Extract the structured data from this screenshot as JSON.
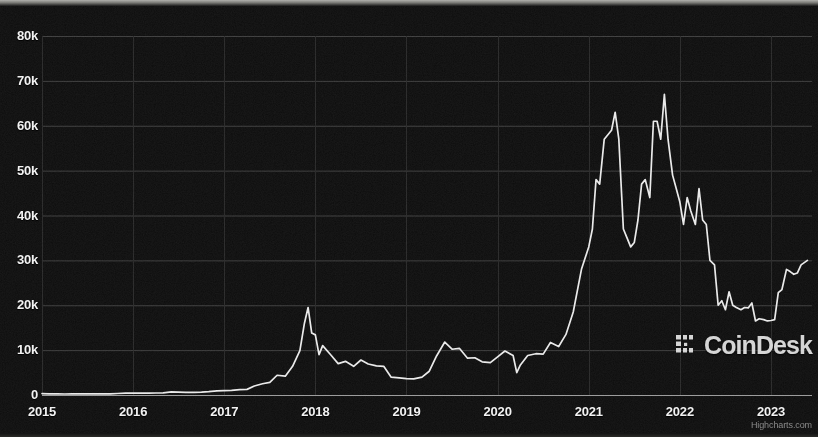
{
  "chart_data": {
    "type": "line",
    "title": "",
    "subtitle": "",
    "xlabel": "",
    "ylabel": "",
    "series_name": "Bitcoin Price (USD)",
    "grid": true,
    "legend_position": "none",
    "line_color": "#e9e9e9",
    "background_color": "#0c0c0c",
    "gridline_color": "#3c3c3c",
    "axis_label_color": "#f2f2f2",
    "xlim": [
      2015.0,
      2023.45
    ],
    "ylim": [
      0,
      80000
    ],
    "y_ticks": [
      0,
      10000,
      20000,
      30000,
      40000,
      50000,
      60000,
      70000,
      80000
    ],
    "y_tick_labels": [
      "0",
      "10k",
      "20k",
      "30k",
      "40k",
      "50k",
      "60k",
      "70k",
      "80k"
    ],
    "x_ticks": [
      2015,
      2016,
      2017,
      2018,
      2019,
      2020,
      2021,
      2022,
      2023
    ],
    "x_tick_labels": [
      "2015",
      "2016",
      "2017",
      "2018",
      "2019",
      "2020",
      "2021",
      "2022",
      "2023"
    ],
    "x": [
      2015.0,
      2015.08,
      2015.17,
      2015.25,
      2015.33,
      2015.42,
      2015.5,
      2015.58,
      2015.67,
      2015.75,
      2015.83,
      2015.92,
      2016.0,
      2016.08,
      2016.17,
      2016.25,
      2016.33,
      2016.42,
      2016.5,
      2016.58,
      2016.67,
      2016.75,
      2016.83,
      2016.92,
      2017.0,
      2017.08,
      2017.17,
      2017.25,
      2017.33,
      2017.42,
      2017.5,
      2017.58,
      2017.67,
      2017.75,
      2017.83,
      2017.88,
      2017.92,
      2017.96,
      2018.0,
      2018.04,
      2018.08,
      2018.17,
      2018.25,
      2018.33,
      2018.42,
      2018.5,
      2018.58,
      2018.67,
      2018.75,
      2018.83,
      2018.92,
      2019.0,
      2019.08,
      2019.17,
      2019.25,
      2019.33,
      2019.42,
      2019.5,
      2019.58,
      2019.67,
      2019.75,
      2019.83,
      2019.92,
      2020.0,
      2020.08,
      2020.17,
      2020.21,
      2020.25,
      2020.33,
      2020.42,
      2020.5,
      2020.58,
      2020.67,
      2020.75,
      2020.83,
      2020.92,
      2021.0,
      2021.04,
      2021.08,
      2021.12,
      2021.17,
      2021.21,
      2021.25,
      2021.29,
      2021.33,
      2021.38,
      2021.42,
      2021.46,
      2021.5,
      2021.54,
      2021.58,
      2021.62,
      2021.67,
      2021.71,
      2021.75,
      2021.79,
      2021.83,
      2021.87,
      2021.92,
      2021.96,
      2022.0,
      2022.04,
      2022.08,
      2022.12,
      2022.17,
      2022.21,
      2022.25,
      2022.29,
      2022.33,
      2022.38,
      2022.42,
      2022.46,
      2022.5,
      2022.54,
      2022.58,
      2022.62,
      2022.67,
      2022.71,
      2022.75,
      2022.79,
      2022.83,
      2022.87,
      2022.92,
      2022.96,
      2023.0,
      2023.04,
      2023.08,
      2023.12,
      2023.17,
      2023.21,
      2023.25,
      2023.29,
      2023.33,
      2023.4
    ],
    "values": [
      315,
      250,
      245,
      225,
      235,
      240,
      275,
      230,
      240,
      250,
      330,
      420,
      435,
      400,
      415,
      450,
      460,
      680,
      655,
      575,
      605,
      640,
      735,
      920,
      975,
      1010,
      1190,
      1250,
      2000,
      2500,
      2800,
      4400,
      4200,
      6400,
      9900,
      16000,
      19500,
      13800,
      13400,
      9000,
      11000,
      8900,
      7000,
      7500,
      6400,
      7800,
      6900,
      6500,
      6400,
      4000,
      3800,
      3650,
      3600,
      4000,
      5300,
      8700,
      11800,
      10200,
      10400,
      8200,
      8300,
      7400,
      7200,
      8500,
      9800,
      8800,
      5000,
      6700,
      8800,
      9200,
      9100,
      11700,
      10800,
      13500,
      18500,
      28000,
      33000,
      37000,
      48000,
      47000,
      57000,
      58000,
      59000,
      63000,
      57000,
      37000,
      35000,
      33000,
      34000,
      39000,
      47000,
      48000,
      44000,
      61000,
      61000,
      57000,
      67000,
      57000,
      49000,
      46000,
      43000,
      38000,
      44000,
      41000,
      38000,
      46000,
      39000,
      38000,
      30000,
      29000,
      20000,
      21000,
      19000,
      23000,
      20000,
      19500,
      19000,
      19500,
      19400,
      20500,
      16500,
      17000,
      16800,
      16500,
      16600,
      16800,
      22800,
      23500,
      28000,
      27500,
      26900,
      27200,
      29000,
      30000
    ],
    "annotations": [
      {
        "name": "coindesk-watermark",
        "text": "CoinDesk"
      },
      {
        "name": "highcharts-credit",
        "text": "Highcharts.com"
      }
    ]
  },
  "watermark": {
    "text": "CoinDesk",
    "logo_icon": "coindesk-bracket-icon"
  },
  "credit": {
    "text": "Highcharts.com"
  }
}
